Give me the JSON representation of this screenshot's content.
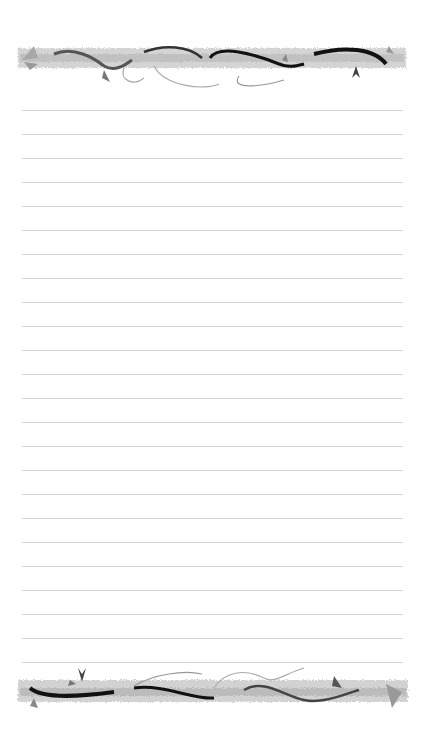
{
  "page": {
    "type": "lined stationery sheet",
    "background_color": "#ffffff",
    "rule_color": "#d6d6d6",
    "rule_count": 24,
    "rule_spacing_px": 24,
    "first_rule_y": 110,
    "rule_left_x": 22,
    "rule_right_x": 403
  },
  "decorations": {
    "top_banner": {
      "motif": "vine-branch-border",
      "colors": [
        "#1a1a1a",
        "#8a8a8a",
        "#cfcfcf"
      ]
    },
    "bottom_banner": {
      "motif": "vine-branch-border",
      "colors": [
        "#1a1a1a",
        "#8a8a8a",
        "#cfcfcf"
      ]
    }
  }
}
